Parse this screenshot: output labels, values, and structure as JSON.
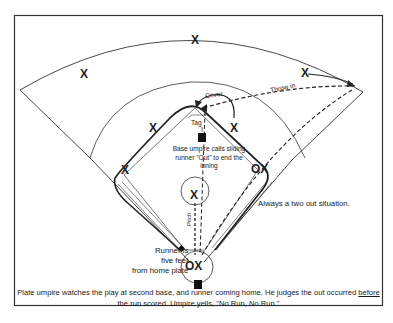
{
  "diagram": {
    "labels": {
      "cover": "Cover",
      "throw_in": "Throw in",
      "tag": "Tag",
      "pitch": "Pitch",
      "base_umpire_note": "Base umpire calls sliding runner \"Out\" to end the inning",
      "runner_note_line1": "Runner is",
      "runner_note_line2": "five feet",
      "runner_note_line3": "from home plate",
      "situation_note": "Always a two out situation."
    },
    "caption": {
      "part1": "Plate umpire watches the play at second base, and runner coming home. He judges the out occurred ",
      "underlined": "before",
      "part2": " the run scored. Umpire yells, \"No Run, No Run.\""
    },
    "markers": {
      "fielder_symbol": "X",
      "catcher_symbol": "X",
      "umpire_symbol": "O",
      "first_base_pair": "OX",
      "home_pair": "OX"
    },
    "players": [
      {
        "role": "left-fielder",
        "symbol": "X"
      },
      {
        "role": "center-fielder",
        "symbol": "X"
      },
      {
        "role": "right-fielder",
        "symbol": "X"
      },
      {
        "role": "shortstop",
        "symbol": "X"
      },
      {
        "role": "second-baseman",
        "symbol": "X"
      },
      {
        "role": "third-baseman",
        "symbol": "X"
      },
      {
        "role": "pitcher",
        "symbol": "X"
      },
      {
        "role": "first-baseman",
        "symbol": "X"
      },
      {
        "role": "catcher",
        "symbol": "X"
      }
    ],
    "umpires": [
      {
        "role": "base-umpire",
        "position": "behind second base (square)"
      },
      {
        "role": "plate-umpire",
        "position": "behind home plate (square)"
      }
    ],
    "colors": {
      "ink": "#222222",
      "background": "#ffffff",
      "border": "#333333"
    }
  }
}
